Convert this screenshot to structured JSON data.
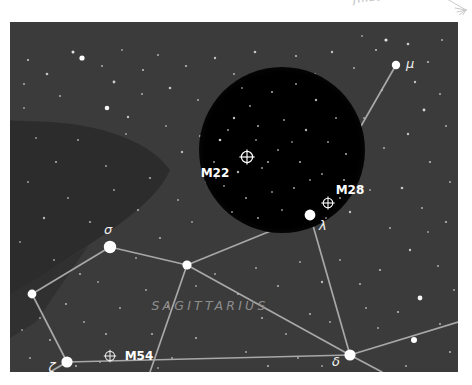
{
  "page": {
    "background_color": "#ffffff",
    "annotation_text": "finds the Teapot"
  },
  "chart": {
    "constellation_name": "SAGITTARIUS",
    "background_color": "#3b3b3b",
    "dark_lane_color": "#2c2c2c",
    "fov_circle_color": "#000000",
    "line_color": "#b4b4b4",
    "star_color": "#ffffff",
    "fov_circle": {
      "label": "telescope-field-of-view",
      "cx": 272,
      "cy": 128,
      "r": 83
    },
    "stars": [
      {
        "id": "mu",
        "label": "μ",
        "x": 386,
        "y": 43,
        "r": 4.2,
        "label_dx": 10,
        "label_dy": 2
      },
      {
        "id": "sigma",
        "label": "σ",
        "x": 100,
        "y": 225,
        "r": 6.0,
        "label_dx": 2,
        "label_dy": -13
      },
      {
        "id": "lambda",
        "label": "λ",
        "x": 300,
        "y": 193,
        "r": 5.2,
        "label_dx": 8,
        "label_dy": 14
      },
      {
        "id": "delta",
        "label": "δ",
        "x": 340,
        "y": 333,
        "r": 5.6,
        "label_dx": -14,
        "label_dy": 10
      },
      {
        "id": "zeta",
        "label": "ζ",
        "x": 57,
        "y": 340,
        "r": 5.6,
        "label_dx": -15,
        "label_dy": 8
      },
      {
        "id": "node-center",
        "label": "",
        "x": 177,
        "y": 243,
        "r": 4.6,
        "label_dx": 0,
        "label_dy": 0
      },
      {
        "id": "node-west",
        "label": "",
        "x": 22,
        "y": 272,
        "r": 4.4,
        "label_dx": 0,
        "label_dy": 0
      }
    ],
    "deep_sky_objects": [
      {
        "id": "m22",
        "label": "M22",
        "symbol_x": 237,
        "symbol_y": 135,
        "label_x": 205,
        "label_y": 155
      },
      {
        "id": "m28",
        "label": "M28",
        "symbol_x": 318,
        "symbol_y": 181,
        "label_x": 324,
        "label_y": 171
      },
      {
        "id": "m54",
        "label": "M54",
        "symbol_x": 110,
        "symbol_y": 355,
        "label_x": 120,
        "label_y": 357
      }
    ],
    "constellation_lines": [
      {
        "from": "mu",
        "to": "lambda"
      },
      {
        "from": "lambda",
        "to": "node-center"
      },
      {
        "from": "lambda",
        "to": "delta"
      },
      {
        "from": "sigma",
        "to": "node-center"
      },
      {
        "from": "sigma",
        "to": "node-west"
      },
      {
        "from": "node-center",
        "to": "delta"
      },
      {
        "from": "node-west",
        "to": "zeta"
      },
      {
        "from": "zeta",
        "to": "delta"
      },
      {
        "from": "delta",
        "to": "east-edge"
      }
    ],
    "labels": {
      "constellation_x": 200,
      "constellation_y": 288
    }
  }
}
